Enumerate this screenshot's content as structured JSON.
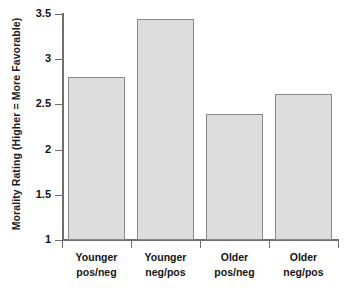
{
  "chart_data": {
    "type": "bar",
    "title": "",
    "xlabel": "",
    "ylabel": "Morality Rating (Higher = More Favorable)",
    "categories": [
      "Younger pos/neg",
      "Younger neg/pos",
      "Older pos/neg",
      "Older neg/pos"
    ],
    "category_lines": [
      [
        "Younger",
        "pos/neg"
      ],
      [
        "Younger",
        "neg/pos"
      ],
      [
        "Older",
        "pos/neg"
      ],
      [
        "Older",
        "neg/pos"
      ]
    ],
    "values": [
      2.8,
      3.45,
      2.39,
      2.62
    ],
    "ylim": [
      1,
      3.5
    ],
    "yticks": [
      1,
      1.5,
      2,
      2.5,
      3,
      3.5
    ],
    "ytick_labels": [
      "1",
      "1.5",
      "2",
      "2.5",
      "3",
      "3.5"
    ],
    "grid": false,
    "legend": null,
    "bar_fill_color": "#dddddd",
    "bar_edge_color": "#8a8a8a",
    "axis_color": "#6e6e6e",
    "background_color": "#ffffff"
  }
}
